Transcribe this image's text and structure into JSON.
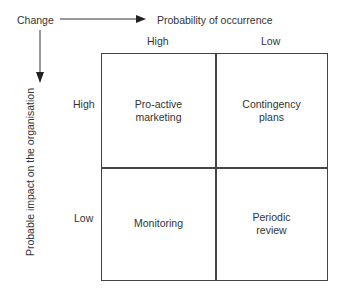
{
  "diagram": {
    "origin_label": "Change",
    "x_axis": {
      "title": "Probability of occurrence",
      "levels": [
        "High",
        "Low"
      ]
    },
    "y_axis": {
      "title": "Probable impact on the organisation",
      "levels": [
        "High",
        "Low"
      ]
    },
    "cells": {
      "high_high": "Pro-active\nmarketing",
      "high_low": "Contingency\nplans",
      "low_high": "Monitoring",
      "low_low": "Periodic\nreview"
    }
  }
}
